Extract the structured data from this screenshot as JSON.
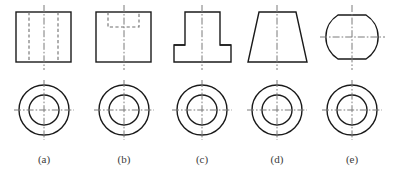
{
  "figure": {
    "name": "orthographic-views-plate",
    "width": 395,
    "height": 172,
    "background_color": "#ffffff",
    "colors": {
      "solid_line": "#1a1a1a",
      "hidden_line": "#6e6e6e",
      "center_line": "#7a7a7a",
      "caption": "#3b3b3b"
    }
  },
  "captions": [
    {
      "id": "caption-a",
      "label": "(a)",
      "x": 44,
      "y": 163
    },
    {
      "id": "caption-b",
      "label": "(b)",
      "x": 124,
      "y": 163
    },
    {
      "id": "caption-c",
      "label": "(c)",
      "x": 202,
      "y": 163
    },
    {
      "id": "caption-d",
      "label": "(d)",
      "x": 277,
      "y": 163
    },
    {
      "id": "caption-e",
      "label": "(e)",
      "x": 352,
      "y": 163
    }
  ],
  "columns": [
    {
      "key": "a",
      "label": "(a)",
      "front_view": {
        "name": "cylinder-with-through-hole-front-view",
        "shape": "rectangle",
        "outline": {
          "x": 16,
          "y": 12,
          "width": 55,
          "height": 50
        },
        "hidden_lines": [
          {
            "x1": 29,
            "y1": 12,
            "x2": 29,
            "y2": 62
          },
          {
            "x1": 58,
            "y1": 12,
            "x2": 58,
            "y2": 62
          }
        ],
        "center_line_vertical": {
          "x": 44,
          "y1": 5,
          "y2": 70
        }
      },
      "top_view": {
        "name": "concentric-circles-top-view",
        "center": {
          "cx": 44,
          "cy": 110
        },
        "outer_radius": 25,
        "inner_radius": 15,
        "center_line_vertical": {
          "x": 44,
          "y1": 80,
          "y2": 140
        },
        "center_line_horizontal": {
          "y": 110,
          "x1": 14,
          "x2": 74
        }
      }
    },
    {
      "key": "b",
      "label": "(b)",
      "front_view": {
        "name": "counterbored-block-front-view",
        "shape": "rectangle-with-dashed-recess",
        "outline": {
          "x": 96,
          "y": 12,
          "width": 55,
          "height": 50
        },
        "hidden_lines": [
          {
            "x1": 108,
            "y1": 12,
            "x2": 108,
            "y2": 27
          },
          {
            "x1": 139,
            "y1": 12,
            "x2": 139,
            "y2": 27
          },
          {
            "x1": 108,
            "y1": 27,
            "x2": 139,
            "y2": 27
          }
        ],
        "center_line_vertical": {
          "x": 124,
          "y1": 5,
          "y2": 70
        }
      },
      "top_view": {
        "name": "concentric-circles-top-view",
        "center": {
          "cx": 124,
          "cy": 110
        },
        "outer_radius": 25,
        "inner_radius": 15,
        "center_line_vertical": {
          "x": 124,
          "y1": 80,
          "y2": 140
        },
        "center_line_horizontal": {
          "y": 110,
          "x1": 94,
          "x2": 154
        }
      }
    },
    {
      "key": "c",
      "label": "(c)",
      "front_view": {
        "name": "stepped-flanged-part-front-view",
        "shape": "t-shape",
        "upper_block": {
          "x": 185,
          "y": 12,
          "width": 35,
          "height": 33
        },
        "lower_base": {
          "x": 174,
          "y": 45,
          "width": 57,
          "height": 17
        },
        "center_line_vertical": {
          "x": 202,
          "y1": 5,
          "y2": 70
        }
      },
      "top_view": {
        "name": "concentric-circles-top-view",
        "center": {
          "cx": 202,
          "cy": 110
        },
        "outer_radius": 25,
        "inner_radius": 15,
        "center_line_vertical": {
          "x": 202,
          "y1": 80,
          "y2": 140
        },
        "center_line_horizontal": {
          "y": 110,
          "x1": 172,
          "x2": 232
        }
      }
    },
    {
      "key": "d",
      "label": "(d)",
      "front_view": {
        "name": "truncated-cone-front-view",
        "shape": "trapezoid",
        "points": "259,12 296,12 307,62 248,62",
        "center_line_vertical": {
          "x": 277,
          "y1": 5,
          "y2": 70
        }
      },
      "top_view": {
        "name": "concentric-circles-top-view",
        "center": {
          "cx": 277,
          "cy": 110
        },
        "outer_radius": 25,
        "inner_radius": 15,
        "center_line_vertical": {
          "x": 277,
          "y1": 80,
          "y2": 140
        },
        "center_line_horizontal": {
          "y": 110,
          "x1": 247,
          "x2": 307
        }
      }
    },
    {
      "key": "e",
      "label": "(e)",
      "front_view": {
        "name": "truncated-sphere-front-view",
        "shape": "circle-flattened-top-and-bottom",
        "path": "M 338,17 L 367,17 A 27 27 0 0 1 367,57 L 338,57 A 27 27 0 0 1 338,17 Z",
        "center_line_vertical": {
          "x": 352,
          "y1": 5,
          "y2": 70
        },
        "center_line_horizontal": {
          "y": 37,
          "x1": 320,
          "x2": 384
        }
      },
      "top_view": {
        "name": "concentric-circles-top-view",
        "center": {
          "cx": 352,
          "cy": 110
        },
        "outer_radius": 25,
        "inner_radius": 15,
        "center_line_vertical": {
          "x": 352,
          "y1": 80,
          "y2": 140
        },
        "center_line_horizontal": {
          "y": 110,
          "x1": 322,
          "x2": 382
        }
      }
    }
  ]
}
